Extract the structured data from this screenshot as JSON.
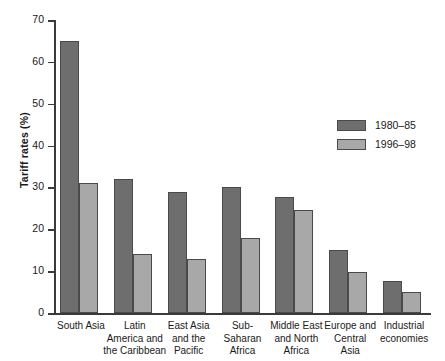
{
  "chart_data": {
    "type": "bar",
    "title": "",
    "xlabel": "",
    "ylabel": "Tariff rates (%)",
    "ylim": [
      0,
      70
    ],
    "yticks": [
      0,
      10,
      20,
      30,
      40,
      50,
      60,
      70
    ],
    "ytick_labels": [
      "0",
      "10",
      "20",
      "30",
      "40",
      "50",
      "60",
      "70"
    ],
    "grid": false,
    "legend_position": "right",
    "categories": [
      "South Asia",
      "Latin\nAmerica and\nthe Caribbean",
      "East Asia\nand the\nPacific",
      "Sub-\nSaharan\nAfrica",
      "Middle East\nand North\nAfrica",
      "Europe and\nCentral\nAsia",
      "Industrial\neconomies"
    ],
    "series": [
      {
        "name": "1980–85",
        "color": "#6e6e6e",
        "values": [
          65,
          32,
          29,
          30,
          27.7,
          15,
          7.7
        ]
      },
      {
        "name": "1996–98",
        "color": "#a8a8a8",
        "values": [
          31,
          14,
          13,
          18,
          24.6,
          9.8,
          5
        ]
      }
    ]
  },
  "legend": {
    "items": [
      {
        "label": "1980–85",
        "color": "#6e6e6e"
      },
      {
        "label": "1996–98",
        "color": "#a8a8a8"
      }
    ]
  }
}
